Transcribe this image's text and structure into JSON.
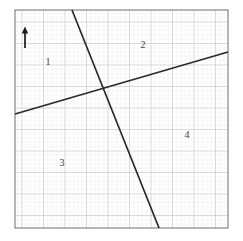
{
  "figure": {
    "canvas": {
      "width": 243,
      "height": 241,
      "background": "#ffffff"
    },
    "grid": {
      "kind": "graph-paper",
      "left": 15,
      "top": 10,
      "right": 228,
      "bottom": 228,
      "minor_spacing": 4.3,
      "major_every": 5,
      "minor_color": "#dcdcdc",
      "major_color": "#b4b4b4",
      "border_color": "#707070",
      "border_width": 1
    },
    "arrow": {
      "name": "up-arrow",
      "x": 25,
      "tail_y": 48,
      "head_y": 27,
      "color": "#1a1a1a",
      "shaft_width": 1.6,
      "head_width": 6,
      "head_length": 6
    },
    "lines": [
      {
        "id": "line-steep-descending",
        "label": "steep descending line",
        "x1": 72,
        "y1": 10,
        "x2": 159,
        "y2": 228,
        "color": "#2a2a2a",
        "width": 1.7
      },
      {
        "id": "line-shallow-ascending",
        "label": "shallow ascending line",
        "x1": 15,
        "y1": 114,
        "x2": 228,
        "y2": 52,
        "color": "#2a2a2a",
        "width": 1.7
      }
    ],
    "intersection": {
      "x": 103,
      "y": 88
    },
    "region_labels": [
      {
        "id": "region-1",
        "text": "1",
        "x": 48,
        "y": 62,
        "color": "#3d3d3d"
      },
      {
        "id": "region-2",
        "text": "2",
        "x": 143,
        "y": 45,
        "color": "#3d3d3d"
      },
      {
        "id": "region-3",
        "text": "3",
        "x": 62,
        "y": 163,
        "color": "#3d3d3d"
      },
      {
        "id": "region-4",
        "text": "4",
        "x": 187,
        "y": 135,
        "color": "#3d3d3d"
      }
    ]
  }
}
